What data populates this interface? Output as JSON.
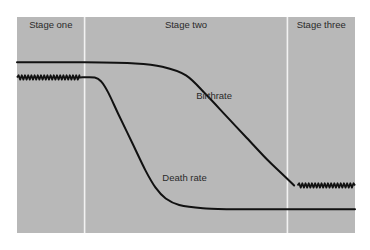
{
  "chart_data": {
    "type": "line",
    "title": "",
    "xlabel": "",
    "ylabel": "",
    "grid": false,
    "legend": "none (curves labeled inline)",
    "colors": {
      "panel": "#b8b8b8",
      "divider": "#f2f2f2",
      "line": "#111111",
      "background": "#ffffff"
    },
    "x_range": [
      0,
      100
    ],
    "y_range": [
      0,
      100
    ],
    "stages": [
      {
        "label": "Stage one",
        "start": 0,
        "end": 20
      },
      {
        "label": "Stage two",
        "start": 20,
        "end": 80
      },
      {
        "label": "Stage three",
        "start": 80,
        "end": 100
      }
    ],
    "series": [
      {
        "name": "Birthrate",
        "label": "Birthrate",
        "label_anchor": {
          "x": 53,
          "y": 62
        },
        "points": [
          {
            "x": 0,
            "y": 79
          },
          {
            "x": 20,
            "y": 79
          },
          {
            "x": 35,
            "y": 78.5
          },
          {
            "x": 43,
            "y": 77
          },
          {
            "x": 50,
            "y": 73
          },
          {
            "x": 56,
            "y": 64
          },
          {
            "x": 62,
            "y": 54
          },
          {
            "x": 68,
            "y": 44
          },
          {
            "x": 74,
            "y": 34
          },
          {
            "x": 78,
            "y": 28
          },
          {
            "x": 82,
            "y": 22
          }
        ],
        "fluctuating_segment": {
          "start": 83,
          "end": 100,
          "y": 22
        }
      },
      {
        "name": "Death rate",
        "label": "Death rate",
        "label_anchor": {
          "x": 43,
          "y": 24
        },
        "fluctuating_segment": {
          "start": 0,
          "end": 18.5,
          "y": 72
        },
        "points": [
          {
            "x": 18.5,
            "y": 72
          },
          {
            "x": 23,
            "y": 72
          },
          {
            "x": 25,
            "y": 70
          },
          {
            "x": 27,
            "y": 65
          },
          {
            "x": 30,
            "y": 55
          },
          {
            "x": 34,
            "y": 42
          },
          {
            "x": 38,
            "y": 29
          },
          {
            "x": 41,
            "y": 21
          },
          {
            "x": 44,
            "y": 16
          },
          {
            "x": 48,
            "y": 13
          },
          {
            "x": 55,
            "y": 11.5
          },
          {
            "x": 65,
            "y": 11
          },
          {
            "x": 100,
            "y": 11
          }
        ]
      }
    ]
  }
}
